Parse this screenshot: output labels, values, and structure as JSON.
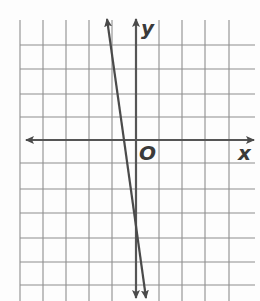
{
  "chart_data": {
    "type": "line",
    "title": "",
    "xlabel": "x",
    "ylabel": "y",
    "origin_label": "O",
    "grid": true,
    "xlim": [
      -5,
      5
    ],
    "ylim": [
      -6,
      5
    ],
    "series": [
      {
        "name": "line",
        "equation": "y = -8x - 4",
        "x": [
          -1.125,
          -0.5,
          0,
          0.2
        ],
        "y": [
          5,
          0,
          -4,
          -5.6
        ],
        "arrows": "both ends"
      }
    ],
    "colors": {
      "grid": "#8a8a8a",
      "axis": "#555555",
      "line": "#4a4a4a"
    }
  },
  "labels": {
    "x": "x",
    "y": "y",
    "origin": "O"
  }
}
